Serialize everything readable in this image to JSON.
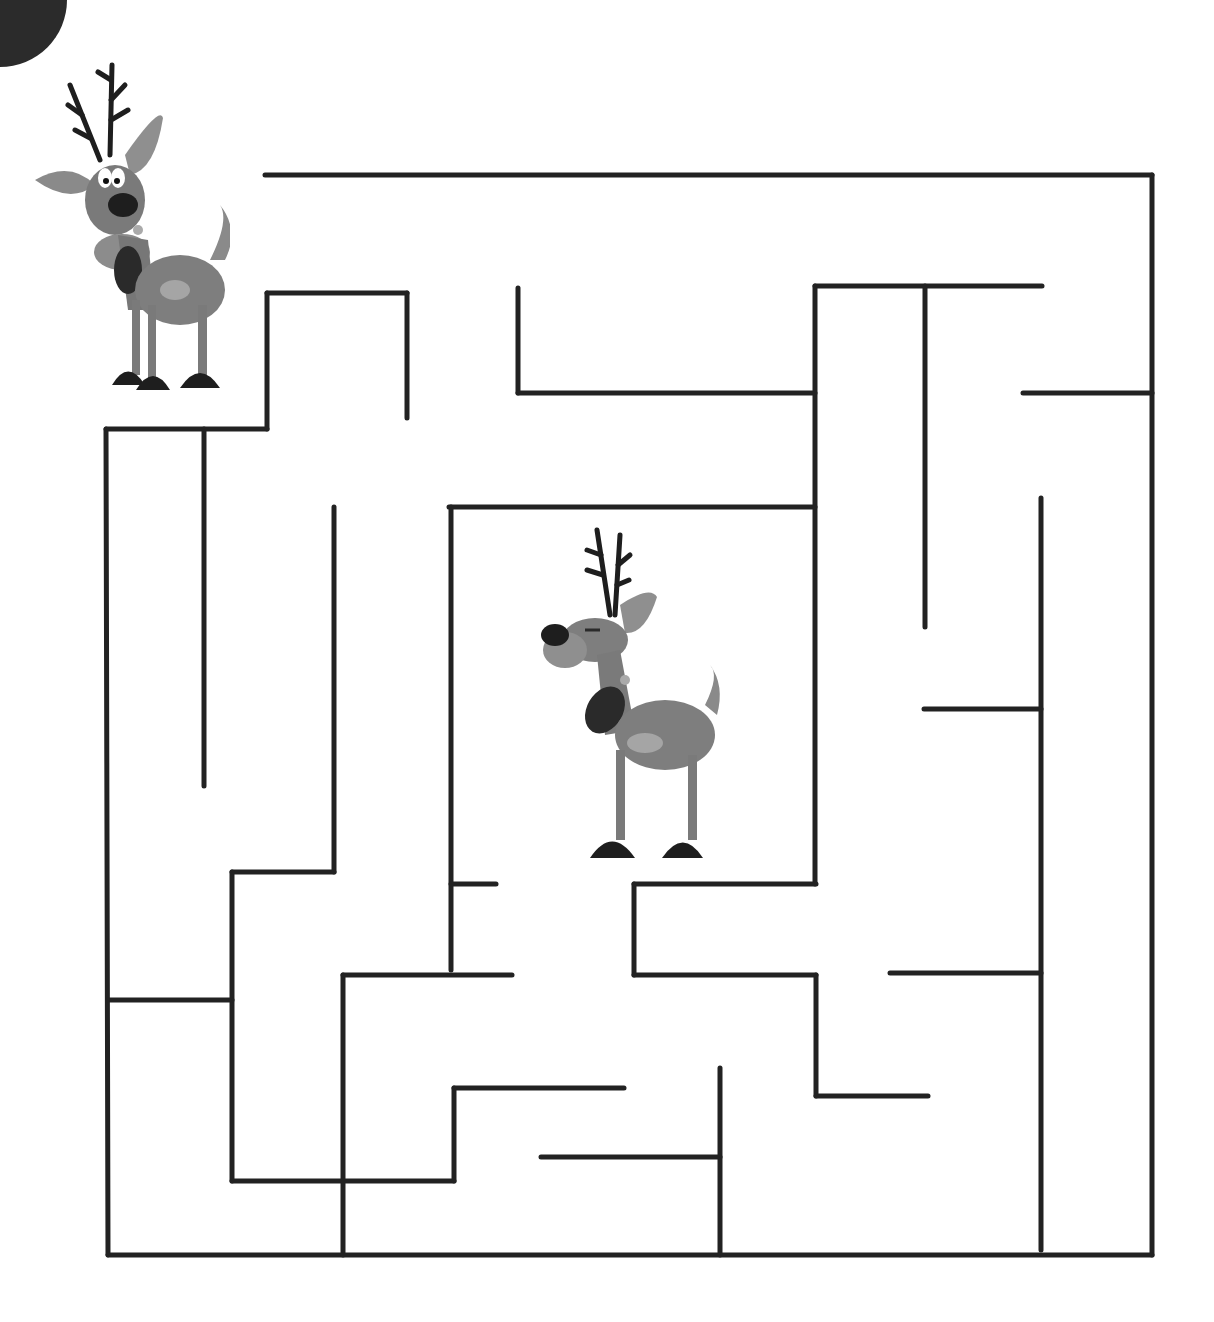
{
  "puzzle": {
    "type": "maze",
    "title": "Reindeer Maze",
    "wall_color": "#222222",
    "background": "#ffffff",
    "corner_color": "#2b2b2b",
    "stroke_width": 5
  },
  "characters": [
    {
      "name": "start-reindeer",
      "role": "start",
      "description": "Surprised reindeer with antlers and dark collar",
      "x": 30,
      "y": 60
    },
    {
      "name": "goal-reindeer",
      "role": "goal",
      "description": "Reindeer with closed eyes and dark collar",
      "x": 525,
      "y": 525
    }
  ],
  "walls": [
    [
      265,
      175,
      1152,
      175
    ],
    [
      1152,
      175,
      1152,
      1255
    ],
    [
      108,
      1255,
      1152,
      1255
    ],
    [
      106,
      429,
      108,
      1255
    ],
    [
      106,
      429,
      267,
      429
    ],
    [
      267,
      293,
      267,
      429
    ],
    [
      267,
      293,
      407,
      293
    ],
    [
      407,
      293,
      407,
      418
    ],
    [
      518,
      288,
      518,
      393
    ],
    [
      518,
      393,
      815,
      393
    ],
    [
      815,
      286,
      1042,
      286
    ],
    [
      815,
      286,
      815,
      884
    ],
    [
      925,
      286,
      925,
      627
    ],
    [
      1023,
      393,
      1152,
      393
    ],
    [
      1041,
      498,
      1041,
      1250
    ],
    [
      924,
      709,
      1041,
      709
    ],
    [
      890,
      973,
      1041,
      973
    ],
    [
      204,
      429,
      204,
      786
    ],
    [
      334,
      507,
      334,
      872
    ],
    [
      232,
      872,
      334,
      872
    ],
    [
      232,
      872,
      232,
      1181
    ],
    [
      108,
      1000,
      232,
      1000
    ],
    [
      232,
      1181,
      454,
      1181
    ],
    [
      449,
      507,
      815,
      507
    ],
    [
      451,
      507,
      451,
      970
    ],
    [
      451,
      884,
      496,
      884
    ],
    [
      343,
      975,
      512,
      975
    ],
    [
      343,
      975,
      343,
      1255
    ],
    [
      454,
      1088,
      454,
      1181
    ],
    [
      454,
      1088,
      624,
      1088
    ],
    [
      634,
      884,
      816,
      884
    ],
    [
      634,
      884,
      634,
      975
    ],
    [
      634,
      975,
      816,
      975
    ],
    [
      816,
      975,
      816,
      1096
    ],
    [
      816,
      1096,
      928,
      1096
    ],
    [
      720,
      1068,
      720,
      1255
    ],
    [
      541,
      1157,
      720,
      1157
    ]
  ]
}
